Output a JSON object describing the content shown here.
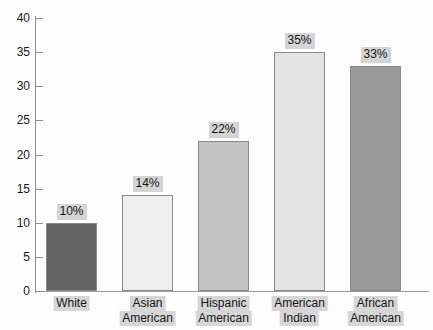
{
  "chart_data": {
    "type": "bar",
    "title": "",
    "subtitle": "",
    "xlabel": "",
    "ylabel": "",
    "ylim": [
      0,
      40
    ],
    "ytick_step": 5,
    "ytick_labels": [
      "0",
      "5",
      "10",
      "15",
      "20",
      "25",
      "30",
      "35",
      "40"
    ],
    "grid": false,
    "legend": "none",
    "categories": [
      "White",
      "Asian American",
      "Hispanic American",
      "American Indian",
      "African American"
    ],
    "category_lines": [
      [
        "White"
      ],
      [
        "Asian",
        "American"
      ],
      [
        "Hispanic",
        "American"
      ],
      [
        "American",
        "Indian"
      ],
      [
        "African",
        "American"
      ]
    ],
    "values": [
      10,
      14,
      22,
      35,
      33
    ],
    "data_labels": [
      "10%",
      "14%",
      "22%",
      "35%",
      "33%"
    ],
    "bar_colors": [
      "#636363",
      "#efefef",
      "#c4c4c4",
      "#e3e3e3",
      "#9a9a9a"
    ],
    "bar_border_color": "#8a8a8a",
    "axis_color": "#8d8d8d",
    "label_highlight_color": "#d4d4d4",
    "background_color": "#fdfdfd"
  }
}
